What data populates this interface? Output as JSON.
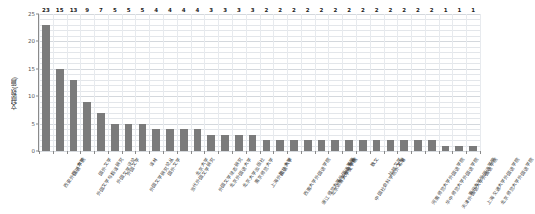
{
  "chart_data": {
    "type": "bar",
    "title": "",
    "xlabel": "",
    "ylabel": "文献数(篇)",
    "ylim": [
      0,
      25
    ],
    "yticks": [
      0,
      5,
      10,
      15,
      20,
      25
    ],
    "ytick_labels": [
      "0",
      "5",
      "10",
      "15",
      "20",
      "25"
    ],
    "grid": true,
    "legend": "none",
    "bar_color": "#7b7b7b",
    "categories": [
      "西安外国语学院",
      "四川大学",
      "外国文学与翻译研究",
      "国外文学",
      "外国文学评论",
      "外国文学",
      "外国文学研究论丛",
      "译林",
      "国外文学",
      "当代外国文学研究",
      "北京大学",
      "外国文学动态研究",
      "北京外国语大学",
      "北京大学出版社",
      "南京师范大学",
      "上海外国语大学",
      "复旦大学",
      "西南大学外国语学院",
      "浙江师范大学外国语学院",
      "北京语言大学文学院",
      "南京师范学院",
      "山东省",
      "中国社会科学院外文所",
      "散文",
      "比较文学",
      "名著",
      "河南师范大学外国语学院",
      "华中师范大学外国语学院",
      "天津外国语大学外国语学院",
      "南开大学外国语学院",
      "上海交通大学外国语学院",
      "北京师范大学外国语学院"
    ],
    "values": [
      23,
      15,
      13,
      9,
      7,
      5,
      5,
      5,
      4,
      4,
      4,
      4,
      3,
      3,
      3,
      3,
      2,
      2,
      2,
      2,
      2,
      2,
      2,
      2,
      2,
      2,
      2,
      2,
      2,
      1,
      1,
      1
    ],
    "value_labels": [
      "23",
      "15",
      "13",
      "9",
      "7",
      "5",
      "5",
      "5",
      "4",
      "4",
      "4",
      "4",
      "3",
      "3",
      "3",
      "3",
      "2",
      "2",
      "2",
      "2",
      "2",
      "2",
      "2",
      "2",
      "2",
      "2",
      "2",
      "2",
      "2",
      "1",
      "1",
      "1"
    ]
  }
}
